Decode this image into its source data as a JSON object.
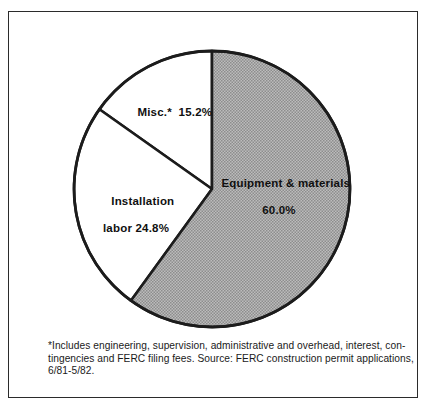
{
  "figure": {
    "background_color": "#ffffff",
    "frame_color": "#2b2b2b"
  },
  "chart_data": {
    "type": "pie",
    "title": "",
    "subtitle": "",
    "xlabel": "",
    "ylabel": "",
    "grid": false,
    "legend_position": "none",
    "label_placement": "inside-slice",
    "start_angle_deg": 0,
    "direction": "clockwise",
    "units": "percent",
    "total": 100.0,
    "categories": [
      "Equipment & materials",
      "Installation labor",
      "Misc.*"
    ],
    "values": [
      60.0,
      24.8,
      15.2
    ],
    "value_labels": [
      "60.0%",
      "24.8%",
      "15.2%"
    ],
    "colors": [
      "#a9a9a9",
      "#ffffff",
      "#ffffff"
    ],
    "slices": [
      {
        "name": "Equipment & materials",
        "value": 60.0,
        "value_label": "60.0%",
        "label_line1": "Equipment & materials",
        "label_line2": "60.0%",
        "fill": "#a9a9a9",
        "fill_style": "halftone-gray",
        "start_deg": 0,
        "sweep_deg": 216.0
      },
      {
        "name": "Installation labor",
        "value": 24.8,
        "value_label": "24.8%",
        "label_line1": "Installation",
        "label_line2": "labor 24.8%",
        "fill": "#ffffff",
        "fill_style": "solid-white",
        "start_deg": 216.0,
        "sweep_deg": 89.28
      },
      {
        "name": "Misc.*",
        "value": 15.2,
        "value_label": "15.2%",
        "label_line1": "Misc.*  15.2%",
        "label_line2": "",
        "fill": "#ffffff",
        "fill_style": "solid-white",
        "start_deg": 305.28,
        "sweep_deg": 54.72
      }
    ],
    "annotations": [
      "*Includes engineering, supervision, administrative and overhead, interest, con-",
      "tingencies and FERC filing fees. Source: FERC construction permit applications,",
      "6/81-5/82."
    ]
  },
  "footnote": {
    "line1": "*Includes engineering, supervision, administrative and overhead, interest, con-",
    "line2": "tingencies and FERC filing fees. Source: FERC construction permit applications,",
    "line3": "6/81-5/82.",
    "source": "FERC construction permit applications, 6/81-5/82"
  }
}
